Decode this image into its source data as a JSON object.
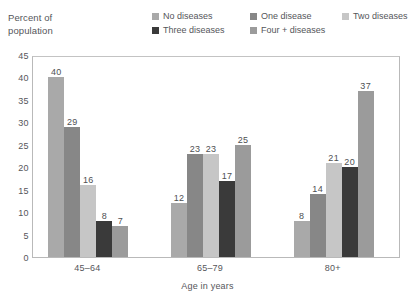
{
  "chart_data": {
    "type": "bar",
    "title": "",
    "subtitle": "",
    "xlabel": "Age in years",
    "ylabel": "Percent of population",
    "categories": [
      "45–64",
      "65–79",
      "80+"
    ],
    "series": [
      {
        "name": "No diseases",
        "color": "#a9a9a9",
        "values": [
          40,
          12,
          8
        ]
      },
      {
        "name": "One disease",
        "color": "#878787",
        "values": [
          29,
          23,
          14
        ]
      },
      {
        "name": "Two diseases",
        "color": "#c6c6c6",
        "values": [
          16,
          23,
          21
        ]
      },
      {
        "name": "Three diseases",
        "color": "#3a3a3a",
        "values": [
          8,
          17,
          20
        ]
      },
      {
        "name": "Four + diseases",
        "color": "#9b9b9b",
        "values": [
          7,
          25,
          37
        ]
      }
    ],
    "ylim": [
      0,
      45
    ],
    "ytick_step": 5,
    "yticks": [
      "0",
      "5",
      "10",
      "15",
      "20",
      "25",
      "30",
      "35",
      "40",
      "45"
    ],
    "grid": false,
    "legend_position": "top",
    "data_labels": true
  },
  "axis": {
    "y_title_line1": "Percent of",
    "y_title_line2": "population",
    "x_title": "Age in years"
  }
}
